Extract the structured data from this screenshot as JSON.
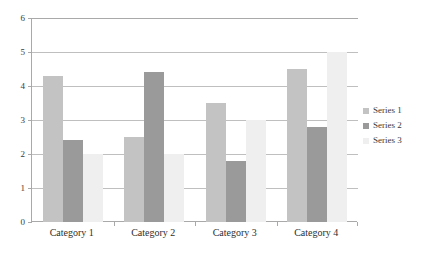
{
  "chart_data": {
    "type": "bar",
    "title": "",
    "subtitle": "",
    "xlabel": "",
    "ylabel": "",
    "categories": [
      "Category 1",
      "Category 2",
      "Category 3",
      "Category 4"
    ],
    "series": [
      {
        "name": "Series 1",
        "values": [
          4.3,
          2.5,
          3.5,
          4.5
        ],
        "color": "#c3c3c3"
      },
      {
        "name": "Series 2",
        "values": [
          2.4,
          4.4,
          1.8,
          2.8
        ],
        "color": "#9a9a9a"
      },
      {
        "name": "Series 3",
        "values": [
          2.0,
          2.0,
          3.0,
          5.0
        ],
        "color": "#efefef"
      }
    ],
    "ylim": [
      0,
      6
    ],
    "yticks": [
      0,
      1,
      2,
      3,
      4,
      5,
      6
    ],
    "ytick_labels": [
      "0",
      "1",
      "2",
      "3",
      "4",
      "5",
      "6"
    ],
    "grid": true,
    "grid_axis": "y",
    "legend_position": "right",
    "axis_color": "#a9a9a9",
    "grid_color": "#bfbfbf",
    "background": "#ffffff"
  }
}
